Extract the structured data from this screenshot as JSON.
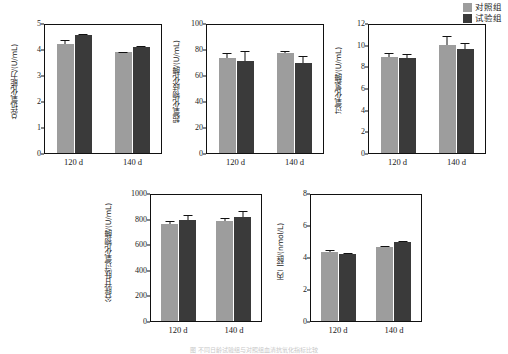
{
  "legend": {
    "items": [
      {
        "label": "对照组",
        "color": "#9d9d9d",
        "name": "control"
      },
      {
        "label": "试验组",
        "color": "#3a3a3a",
        "name": "test"
      }
    ]
  },
  "caption": "图  不同日龄试验组与对照组血清抗氧化指标比较",
  "chart_data": [
    {
      "type": "bar",
      "id": "total-antioxidant-capacity",
      "title": "",
      "ylabel": "总抗氧化能力/(U/mL)",
      "xlabel": "",
      "categories": [
        "120 d",
        "140 d"
      ],
      "ticks": [
        0,
        1,
        2,
        3,
        4,
        5
      ],
      "ylim": [
        0,
        5
      ],
      "grid": false,
      "series": [
        {
          "name": "对照组",
          "color": "#9d9d9d",
          "values": [
            4.27,
            3.93
          ],
          "errors": [
            0.13,
            0.03
          ]
        },
        {
          "name": "试验组",
          "color": "#3a3a3a",
          "values": [
            4.6,
            4.15
          ],
          "errors": [
            0.04,
            0.04
          ]
        }
      ]
    },
    {
      "type": "bar",
      "id": "superoxide-dismutase",
      "title": "",
      "ylabel": "超氧化物歧化酶/(U/mL)",
      "xlabel": "",
      "categories": [
        "120 d",
        "140 d"
      ],
      "ticks": [
        0,
        20,
        40,
        60,
        80,
        100
      ],
      "ylim": [
        0,
        100
      ],
      "grid": false,
      "series": [
        {
          "name": "对照组",
          "color": "#9d9d9d",
          "values": [
            74,
            78
          ],
          "errors": [
            4,
            2
          ]
        },
        {
          "name": "试验组",
          "color": "#3a3a3a",
          "values": [
            72,
            70
          ],
          "errors": [
            8,
            6
          ]
        }
      ]
    },
    {
      "type": "bar",
      "id": "catalase",
      "title": "",
      "ylabel": "过氧化氢酶/(U/mL)",
      "xlabel": "",
      "categories": [
        "120 d",
        "140 d"
      ],
      "ticks": [
        0,
        2,
        4,
        6,
        8,
        10,
        12
      ],
      "ylim": [
        0,
        12
      ],
      "grid": false,
      "series": [
        {
          "name": "对照组",
          "color": "#9d9d9d",
          "values": [
            9.0,
            10.1
          ],
          "errors": [
            0.4,
            0.85
          ]
        },
        {
          "name": "试验组",
          "color": "#3a3a3a",
          "values": [
            8.9,
            9.75
          ],
          "errors": [
            0.4,
            0.6
          ]
        }
      ]
    },
    {
      "type": "bar",
      "id": "glutathione-peroxidase",
      "title": "",
      "ylabel": "谷胱甘肽过氧化物酶/(U/mL)",
      "xlabel": "",
      "categories": [
        "120 d",
        "140 d"
      ],
      "ticks": [
        0,
        200,
        400,
        600,
        800,
        1000
      ],
      "ylim": [
        0,
        1000
      ],
      "grid": false,
      "series": [
        {
          "name": "对照组",
          "color": "#9d9d9d",
          "values": [
            770,
            790
          ],
          "errors": [
            22,
            28
          ]
        },
        {
          "name": "试验组",
          "color": "#3a3a3a",
          "values": [
            805,
            825
          ],
          "errors": [
            38,
            48
          ]
        }
      ]
    },
    {
      "type": "bar",
      "id": "malondialdehyde",
      "title": "",
      "ylabel": "丙二醛/(nmol/L)",
      "xlabel": "",
      "categories": [
        "120 d",
        "140 d"
      ],
      "ticks": [
        0,
        2,
        4,
        6,
        8
      ],
      "ylim": [
        0,
        8
      ],
      "grid": false,
      "series": [
        {
          "name": "对照组",
          "color": "#9d9d9d",
          "values": [
            4.4,
            4.72
          ],
          "errors": [
            0.08,
            0.06
          ]
        },
        {
          "name": "试验组",
          "color": "#3a3a3a",
          "values": [
            4.25,
            5.0
          ],
          "errors": [
            0.05,
            0.09
          ]
        }
      ]
    }
  ],
  "layout": {
    "panels": [
      {
        "left": 6,
        "top": 8,
        "width": 158,
        "height": 168,
        "plotLeft": 38,
        "plotTop": 16,
        "plotWidth": 118,
        "plotHeight": 130
      },
      {
        "left": 168,
        "top": 8,
        "width": 158,
        "height": 168,
        "plotLeft": 38,
        "plotTop": 16,
        "plotWidth": 118,
        "plotHeight": 130
      },
      {
        "left": 330,
        "top": 8,
        "width": 172,
        "height": 168,
        "plotLeft": 38,
        "plotTop": 16,
        "plotWidth": 118,
        "plotHeight": 130
      },
      {
        "left": 100,
        "top": 182,
        "width": 172,
        "height": 166,
        "plotLeft": 50,
        "plotTop": 12,
        "plotWidth": 112,
        "plotHeight": 128
      },
      {
        "left": 272,
        "top": 182,
        "width": 160,
        "height": 166,
        "plotLeft": 38,
        "plotTop": 12,
        "plotWidth": 112,
        "plotHeight": 128
      }
    ]
  }
}
